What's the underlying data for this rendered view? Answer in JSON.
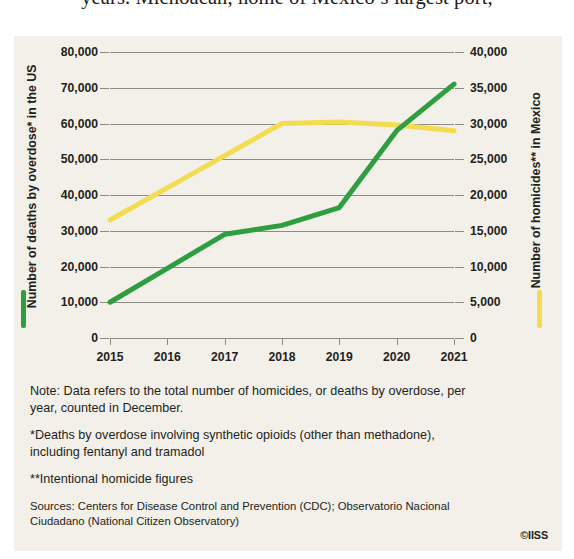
{
  "page": {
    "cutoff_body_text": "years. Michoacán, home of Mexico’s largest port,",
    "credit": "©IISS"
  },
  "chart_data": {
    "type": "line",
    "title": "",
    "xlabel": "",
    "categories": [
      "2015",
      "2016",
      "2017",
      "2018",
      "2019",
      "2020",
      "2021"
    ],
    "grid": true,
    "legend_position": "axis-titles",
    "axes": {
      "left": {
        "label": "Number of deaths by overdose* in the US",
        "ticks": [
          "0",
          "10,000",
          "20,000",
          "30,000",
          "40,000",
          "50,000",
          "60,000",
          "70,000",
          "80,000"
        ],
        "tick_values": [
          0,
          10000,
          20000,
          30000,
          40000,
          50000,
          60000,
          70000,
          80000
        ],
        "ylim": [
          0,
          80000
        ],
        "color": "#2f9e41"
      },
      "right": {
        "label": "Number of homicides** in Mexico",
        "ticks": [
          "0",
          "5,000",
          "10,000",
          "15,000",
          "20,000",
          "25,000",
          "30,000",
          "35,000",
          "40,000"
        ],
        "tick_values": [
          0,
          5000,
          10000,
          15000,
          20000,
          25000,
          30000,
          35000,
          40000
        ],
        "ylim": [
          0,
          40000
        ],
        "color": "#f3dc52"
      }
    },
    "series": [
      {
        "name": "Number of deaths by overdose* in the US",
        "axis": "left",
        "color": "#2f9e41",
        "values": [
          10000,
          19500,
          29000,
          31500,
          36500,
          58000,
          71000
        ]
      },
      {
        "name": "Number of homicides** in Mexico",
        "axis": "right",
        "color": "#f3dc52",
        "values": [
          16500,
          21000,
          25500,
          30000,
          30200,
          29800,
          29000
        ]
      }
    ]
  },
  "notes": [
    "Note: Data refers to the total number of homicides, or deaths by overdose, per year, counted in December.",
    "*Deaths by overdose involving synthetic opioids (other than methadone), including fentanyl and tramadol",
    "**Intentional homicide figures"
  ],
  "sources": "Sources: Centers for Disease Control and Prevention (CDC); Observatorio Nacional Ciudadano (National Citizen Observatory)"
}
